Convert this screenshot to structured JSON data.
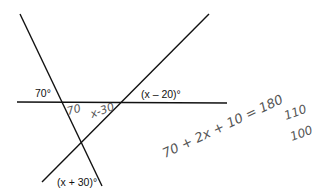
{
  "diagram": {
    "lines": [
      {
        "name": "transversal-left",
        "x1": 20,
        "y1": 14,
        "x2": 102,
        "y2": 186
      },
      {
        "name": "transversal-right",
        "x1": 42,
        "y1": 182,
        "x2": 209,
        "y2": 14
      },
      {
        "name": "horizontal-line",
        "x1": 17,
        "y1": 102,
        "x2": 227,
        "y2": 103
      }
    ],
    "labels": {
      "angle_70": "70°",
      "angle_x_minus_20": "(x – 20)°",
      "angle_x_plus_30": "(x + 30)°"
    },
    "handwriting": {
      "inner_70": "70",
      "inner_x_minus": "x-30",
      "equation": "70 + 2x + 10 = 180",
      "line2": "110",
      "line3": "100"
    }
  }
}
